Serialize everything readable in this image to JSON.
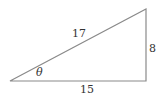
{
  "diagram": {
    "type": "right-triangle",
    "stroke_color": "#8a8a8a",
    "text_color": "#333333",
    "labels": {
      "hypotenuse": "17",
      "opposite": "8",
      "adjacent": "15",
      "angle": "θ"
    }
  }
}
